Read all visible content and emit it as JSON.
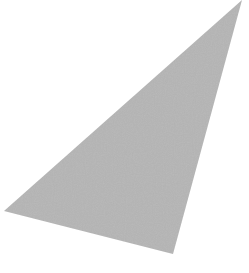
{
  "canvas": {
    "width": 249,
    "height": 273,
    "background": "#ffffff"
  },
  "shape": {
    "type": "triangle",
    "points": "242,0 4,211 173,254",
    "fill": "#b5b5b5"
  }
}
